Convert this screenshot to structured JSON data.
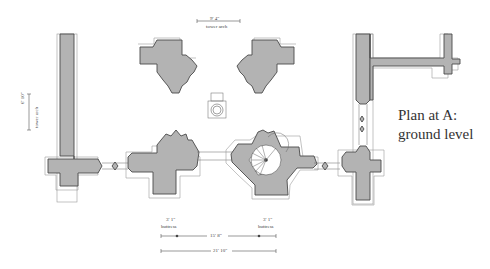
{
  "plan": {
    "title_line1": "Plan at A:",
    "title_line2": "ground level"
  },
  "dimensions": {
    "tower_arch_top": {
      "value": "9' 4\"",
      "label": "tower arch"
    },
    "tower_arch_left": {
      "value": "6' 10\"",
      "label": "tower arch"
    },
    "buttress_left": {
      "value": "3' 1\"",
      "label": "buttress"
    },
    "buttress_right": {
      "value": "3' 1\"",
      "label": "buttress"
    },
    "inner_span": {
      "value": "15' 8\""
    },
    "overall_span": {
      "value": "21' 10\""
    }
  },
  "colors": {
    "wall_fill": "#b3b3b3",
    "wall_stroke": "#4a4a4a",
    "background": "#ffffff"
  }
}
